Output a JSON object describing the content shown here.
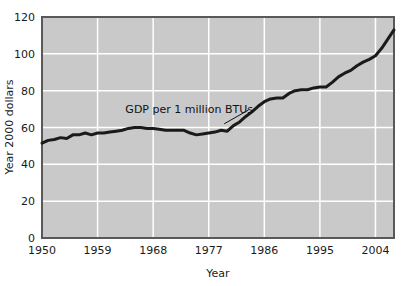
{
  "chart_data": {
    "type": "line",
    "title": "",
    "xlabel": "Year",
    "ylabel": "Year 2000 dollars",
    "xlim": [
      1950,
      2007
    ],
    "ylim": [
      0,
      120
    ],
    "grid": true,
    "legend_position": "none",
    "xticks": [
      "1950",
      "1959",
      "1968",
      "1977",
      "1986",
      "1995",
      "2004"
    ],
    "xtick_values": [
      1950,
      1959,
      1968,
      1977,
      1986,
      1995,
      2004
    ],
    "yticks": [
      "0",
      "20",
      "40",
      "60",
      "80",
      "100",
      "120"
    ],
    "ytick_values": [
      0,
      20,
      40,
      60,
      80,
      100,
      120
    ],
    "annotations": [
      {
        "text": "GDP per 1 million BTUs",
        "x": 1963.5,
        "y": 70,
        "leader_to_x": 1979.5,
        "leader_to_y": 62
      }
    ],
    "series": [
      {
        "name": "GDP per 1 million BTUs",
        "color": "#1a1a1a",
        "x": [
          1950,
          1951,
          1952,
          1953,
          1954,
          1955,
          1956,
          1957,
          1958,
          1959,
          1960,
          1961,
          1962,
          1963,
          1964,
          1965,
          1966,
          1967,
          1968,
          1969,
          1970,
          1971,
          1972,
          1973,
          1974,
          1975,
          1976,
          1977,
          1978,
          1979,
          1980,
          1981,
          1982,
          1983,
          1984,
          1985,
          1986,
          1987,
          1988,
          1989,
          1990,
          1991,
          1992,
          1993,
          1994,
          1995,
          1996,
          1997,
          1998,
          1999,
          2000,
          2001,
          2002,
          2003,
          2004,
          2005,
          2006,
          2007
        ],
        "values": [
          51.5,
          53.0,
          53.5,
          54.5,
          54.0,
          56.0,
          56.0,
          57.0,
          56.0,
          57.0,
          57.0,
          57.5,
          58.0,
          58.5,
          59.5,
          60.0,
          60.0,
          59.5,
          59.5,
          59.0,
          58.5,
          58.5,
          58.5,
          58.5,
          57.0,
          56.0,
          56.5,
          57.0,
          57.5,
          58.5,
          58.0,
          61.0,
          63.0,
          66.0,
          68.5,
          71.5,
          74.0,
          75.5,
          76.0,
          76.0,
          78.5,
          80.0,
          80.5,
          80.5,
          81.5,
          82.0,
          82.0,
          84.5,
          87.5,
          89.5,
          91.0,
          93.5,
          95.5,
          97.0,
          99.0,
          103.0,
          108.0,
          113.0
        ]
      }
    ]
  },
  "figure": {
    "plot_background_color": "#c9c9c9",
    "grid_color": "#ffffff",
    "border_color": "#595959",
    "line_color": "#1a1a1a",
    "page_background_color": "#ffffff"
  }
}
